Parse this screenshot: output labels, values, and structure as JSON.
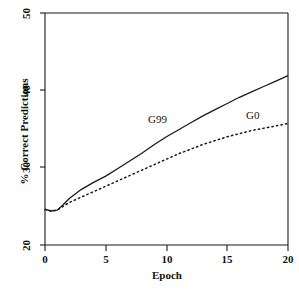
{
  "chart_data": {
    "type": "line",
    "title": "",
    "xlabel": "Epoch",
    "ylabel": "% Correct Predictions",
    "xlim": [
      0,
      20
    ],
    "ylim": [
      20,
      50
    ],
    "xticks": [
      0,
      5,
      10,
      15,
      20
    ],
    "xtick_labels": [
      "0",
      "5",
      "10",
      "15",
      "20"
    ],
    "yticks": [
      20,
      30,
      40,
      50
    ],
    "ytick_labels": [
      "20",
      "30",
      "40",
      "50"
    ],
    "grid": false,
    "legend_position": "inline-annotation",
    "series": [
      {
        "name": "G99",
        "style": "solid",
        "color": "#1a1a1a",
        "x": [
          0,
          0.5,
          1,
          1.5,
          2,
          3,
          4,
          5,
          6,
          7,
          8,
          9,
          10,
          11,
          12,
          13,
          14,
          15,
          16,
          17,
          18,
          19,
          20
        ],
        "values": [
          24.6,
          24.4,
          24.5,
          25.2,
          26.0,
          27.2,
          28.1,
          28.9,
          29.9,
          30.9,
          31.9,
          33.0,
          34.0,
          34.9,
          35.8,
          36.7,
          37.5,
          38.3,
          39.1,
          39.8,
          40.5,
          41.2,
          41.9
        ]
      },
      {
        "name": "G0",
        "style": "dotted",
        "color": "#1a1a1a",
        "x": [
          0,
          0.5,
          1,
          1.5,
          2,
          3,
          4,
          5,
          6,
          7,
          8,
          9,
          10,
          11,
          12,
          13,
          14,
          15,
          16,
          17,
          18,
          19,
          20
        ],
        "values": [
          24.6,
          24.4,
          24.5,
          25.0,
          25.5,
          26.2,
          26.9,
          27.6,
          28.3,
          29.0,
          29.7,
          30.4,
          31.1,
          31.8,
          32.4,
          33.0,
          33.5,
          34.0,
          34.4,
          34.8,
          35.1,
          35.4,
          35.7
        ]
      }
    ],
    "annotations": [
      {
        "text": "G99",
        "x": 10.2,
        "y": 35.5
      },
      {
        "text": "G0",
        "x": 18.5,
        "y": 36.0
      }
    ]
  }
}
